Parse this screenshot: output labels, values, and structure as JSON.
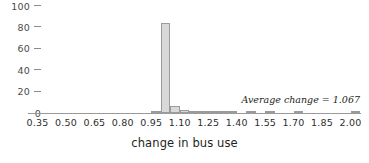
{
  "chart_data": {
    "type": "bar",
    "title": "",
    "subtitle": "",
    "xlabel": "change in bus use",
    "ylabel": "",
    "xlim": [
      0.3,
      2.05
    ],
    "ylim": [
      0,
      100
    ],
    "grid": false,
    "legend": "none",
    "bin_width": 0.05,
    "annotations": [
      {
        "text": "Average change = 1.067",
        "x": 1.78,
        "y": 11
      }
    ],
    "x_ticks": [
      "0.35",
      "0.50",
      "0.65",
      "0.80",
      "0.95",
      "1.10",
      "1.25",
      "1.40",
      "1.55",
      "1.70",
      "1.85",
      "2.00"
    ],
    "x_tick_values": [
      0.35,
      0.5,
      0.65,
      0.8,
      0.95,
      1.1,
      1.25,
      1.4,
      1.55,
      1.7,
      1.85,
      2.0
    ],
    "y_ticks": [
      "0",
      "20",
      "40",
      "60",
      "80",
      "100"
    ],
    "y_tick_values": [
      0,
      20,
      40,
      60,
      80,
      100
    ],
    "bin_starts": [
      0.3,
      0.35,
      0.4,
      0.45,
      0.5,
      0.55,
      0.6,
      0.65,
      0.7,
      0.75,
      0.8,
      0.85,
      0.9,
      0.95,
      1.0,
      1.05,
      1.1,
      1.15,
      1.2,
      1.25,
      1.3,
      1.35,
      1.4,
      1.45,
      1.5,
      1.55,
      1.6,
      1.65,
      1.7,
      1.75,
      1.8,
      1.85,
      1.9,
      1.95,
      2.0
    ],
    "categories": [
      "0.30",
      "0.35",
      "0.40",
      "0.45",
      "0.50",
      "0.55",
      "0.60",
      "0.65",
      "0.70",
      "0.75",
      "0.80",
      "0.85",
      "0.90",
      "0.95",
      "1.00",
      "1.05",
      "1.10",
      "1.15",
      "1.20",
      "1.25",
      "1.30",
      "1.35",
      "1.40",
      "1.45",
      "1.50",
      "1.55",
      "1.60",
      "1.65",
      "1.70",
      "1.75",
      "1.80",
      "1.85",
      "1.90",
      "1.95",
      "2.00"
    ],
    "values": [
      0,
      0,
      0,
      0,
      0,
      0,
      0,
      0,
      0,
      0,
      0,
      0,
      0,
      1,
      84,
      7,
      3,
      2,
      1,
      1,
      1,
      1,
      0,
      1,
      0,
      1,
      0,
      0,
      1,
      0,
      0,
      0,
      0,
      0,
      1
    ],
    "colors": {
      "bar_fill": "#d9d9d9",
      "bar_edge": "#9b9b9b",
      "axis": "#9a9a9a",
      "text": "#231f20"
    }
  }
}
